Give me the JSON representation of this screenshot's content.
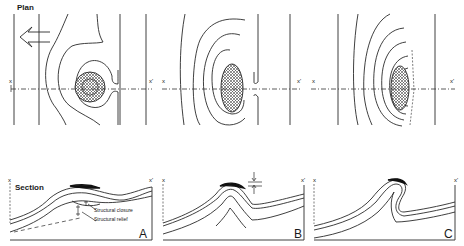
{
  "figure": {
    "plan_label": "Plan",
    "section_label": "Section",
    "arrow_icon": "left-arrow-icon",
    "panels": [
      {
        "id": "A",
        "letter": "A",
        "axis_start": "x",
        "axis_end": "x'",
        "annotations": [
          "Structural closure",
          "Structural relief"
        ]
      },
      {
        "id": "B",
        "letter": "B",
        "axis_start": "x",
        "axis_end": "x'",
        "annotations": []
      },
      {
        "id": "C",
        "letter": "C",
        "axis_start": "x",
        "axis_end": "x'",
        "annotations": []
      }
    ],
    "colors": {
      "line": "#2a2a2a",
      "background": "#ffffff",
      "hatch_fill": "#555555"
    }
  }
}
